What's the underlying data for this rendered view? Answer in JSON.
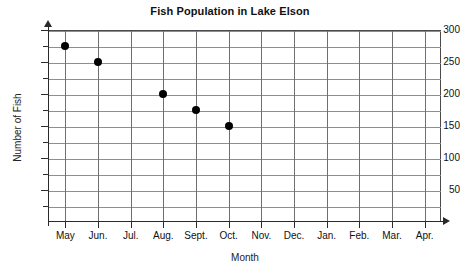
{
  "chart_data": {
    "type": "scatter",
    "title": "Fish Population in Lake Elson",
    "xlabel": "Month",
    "ylabel": "Number of Fish",
    "categories": [
      "May",
      "Jun.",
      "Jul.",
      "Aug.",
      "Sept.",
      "Oct.",
      "Nov.",
      "Dec.",
      "Jan.",
      "Feb.",
      "Mar.",
      "Apr."
    ],
    "values": [
      275,
      250,
      null,
      200,
      175,
      150,
      null,
      null,
      null,
      null,
      null,
      null
    ],
    "points": [
      {
        "x": "May",
        "y": 275
      },
      {
        "x": "Jun.",
        "y": 250
      },
      {
        "x": "Aug.",
        "y": 200
      },
      {
        "x": "Sept.",
        "y": 175
      },
      {
        "x": "Oct.",
        "y": 150
      }
    ],
    "ylim": [
      0,
      300
    ],
    "y_major_ticks": [
      50,
      100,
      150,
      200,
      250,
      300
    ],
    "y_tick_labels": [
      "50",
      "100",
      "150",
      "200",
      "250",
      "300"
    ],
    "y_minor_interval": 25,
    "grid": true,
    "legend": null,
    "marker_color": "#000000",
    "grid_color": "#8e8e8e",
    "axis_color": "#2a2a2a"
  }
}
